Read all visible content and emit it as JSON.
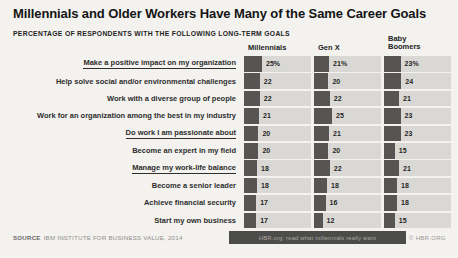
{
  "chart_data": {
    "type": "bar",
    "orientation": "horizontal",
    "title": "Millennials and Older Workers Have Many of the Same Career Goals",
    "subtitle": "PERCENTAGE OF RESPONDENTS WITH THE FOLLOWING LONG-TERM GOALS",
    "categories": [
      "Make a positive impact on my organization",
      "Help solve social and/or environmental challenges",
      "Work with a diverse group of people",
      "Work for an organization among the best in my industry",
      "Do work I am passionate about",
      "Become an expert in my field",
      "Manage my work-life balance",
      "Become a senior leader",
      "Achieve financial security",
      "Start my own business"
    ],
    "series": [
      {
        "name": "Millennials",
        "values": [
          25,
          22,
          22,
          21,
          20,
          20,
          18,
          18,
          17,
          17
        ]
      },
      {
        "name": "Gen X",
        "values": [
          21,
          20,
          22,
          25,
          21,
          20,
          22,
          18,
          16,
          12
        ]
      },
      {
        "name": "Baby Boomers",
        "values": [
          23,
          24,
          21,
          23,
          23,
          15,
          21,
          18,
          18,
          15
        ]
      }
    ],
    "value_suffix_first_row": "%",
    "underlined_category_indexes": [
      0,
      4,
      6
    ],
    "xlim": [
      0,
      25
    ],
    "legend_position": "top",
    "grid": false
  },
  "footer": {
    "source_label": "SOURCE",
    "source_text": "IBM INSTITUTE FOR BUSINESS VALUE, 2014",
    "watermark": "HBR.org: read what millennials really want",
    "copyright": "© HBR.ORG"
  },
  "colors": {
    "background": "#f3f2ef",
    "bar": "#565553",
    "track": "#d9d8d4",
    "title_text": "#141414",
    "watermark_bg": "#4c4c4a"
  }
}
